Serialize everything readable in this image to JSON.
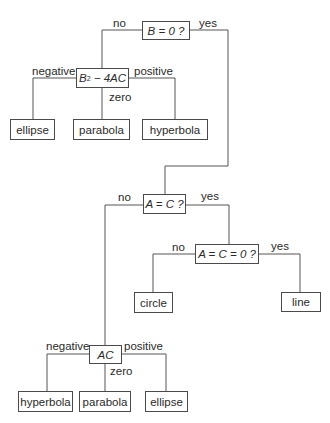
{
  "diagram": {
    "type": "decision-tree",
    "title": "",
    "nodes": {
      "root": {
        "label": "B = 0 ?"
      },
      "discriminant": {
        "label_base": "B",
        "label_sup": "2",
        "label_rest": " − 4AC"
      },
      "disc_negative": {
        "label": "ellipse"
      },
      "disc_zero": {
        "label": "parabola"
      },
      "disc_positive": {
        "label": "hyperbola"
      },
      "a_eq_c": {
        "label": "A = C ?"
      },
      "a_eq_c_eq_0": {
        "label": "A = C = 0 ?"
      },
      "circle": {
        "label": "circle"
      },
      "line": {
        "label": "line"
      },
      "ac": {
        "label": "AC"
      },
      "ac_negative": {
        "label": "hyperbola"
      },
      "ac_zero": {
        "label": "parabola"
      },
      "ac_positive": {
        "label": "ellipse"
      }
    },
    "edge_labels": {
      "root_no": "no",
      "root_yes": "yes",
      "disc_negative": "negative",
      "disc_zero": "zero",
      "disc_positive": "positive",
      "aeqc_no": "no",
      "aeqc_yes": "yes",
      "aeqc0_no": "no",
      "aeqc0_yes": "yes",
      "ac_negative": "negative",
      "ac_zero": "zero",
      "ac_positive": "positive"
    },
    "line_color": "#4a4a4a"
  }
}
